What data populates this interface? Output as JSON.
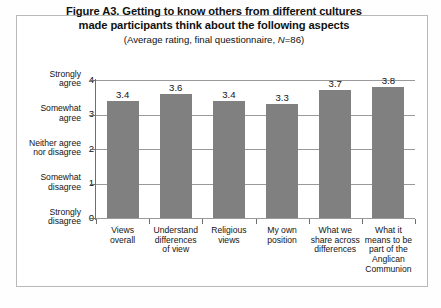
{
  "chart_data": {
    "type": "bar",
    "title": "Figure A3. Getting to know others from different cultures made participants think about the following aspects",
    "title_lines": [
      "Figure A3. Getting to know others from different cultures",
      "made participants think about the following aspects"
    ],
    "subtitle": "(Average rating, final questionnaire, N=86)",
    "subtitle_parts": {
      "before": "(Average rating, final questionnaire, ",
      "italic": "N",
      "after": "=86)"
    },
    "categories": [
      "Views overall",
      "Understand differences of view",
      "Religious views",
      "My own position",
      "What we share across differences",
      "What it means to be part of the Anglican Communion"
    ],
    "category_lines": [
      [
        "Views",
        "overall"
      ],
      [
        "Understand",
        "differences",
        "of view"
      ],
      [
        "Religious",
        "views"
      ],
      [
        "My own",
        "position"
      ],
      [
        "What we",
        "share across",
        "differences"
      ],
      [
        "What it",
        "means to be",
        "part of the",
        "Anglican",
        "Communion"
      ]
    ],
    "values": [
      3.4,
      3.6,
      3.4,
      3.3,
      3.7,
      3.8
    ],
    "value_labels": [
      "3.4",
      "3.6",
      "3.4",
      "3.3",
      "3.7",
      "3.8"
    ],
    "xlabel": "",
    "ylabel": "",
    "ylim": [
      0,
      4
    ],
    "y_ticks": [
      0,
      1,
      2,
      3,
      4
    ],
    "y_tick_labels": [
      "0",
      "1",
      "2",
      "3",
      "4"
    ],
    "y_tick_descriptions": [
      [
        "Strongly",
        "disagree"
      ],
      [
        "Somewhat",
        "disagree"
      ],
      [
        "Neither agree",
        "nor disagree"
      ],
      [
        "Somewhat",
        "agree"
      ],
      [
        "Strongly",
        "agree"
      ]
    ],
    "grid": true,
    "legend": false,
    "bar_color": "#808080",
    "gridline_color": "#9a9a9a",
    "axis_color": "#6e6e6e",
    "frame_color": "#b9b9b9",
    "background": "#ffffff",
    "n": 86
  }
}
